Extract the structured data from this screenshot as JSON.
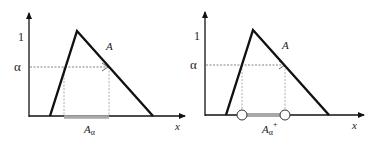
{
  "figure": {
    "panels": [
      {
        "id": "alpha-cut",
        "y_tick_one": "1",
        "alpha_label": "α",
        "set_label": "A",
        "x_axis_label": "x",
        "cut_label_base": "A",
        "cut_label_sub": "α",
        "cut_label_sup": "",
        "interval_type": "closed"
      },
      {
        "id": "strong-alpha-cut",
        "y_tick_one": "1",
        "alpha_label": "α",
        "set_label": "A",
        "x_axis_label": "x",
        "cut_label_base": "A",
        "cut_label_sub": "α",
        "cut_label_sup": "+",
        "interval_type": "open"
      }
    ],
    "colors": {
      "axis": "#111111",
      "triangle": "#111111",
      "dashed": "#888888",
      "interval": "#a8a8a8",
      "endpoint_fill": "#ffffff"
    }
  }
}
